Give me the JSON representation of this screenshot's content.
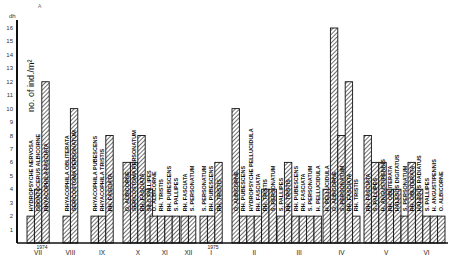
{
  "chart_data": {
    "type": "bar",
    "title": "",
    "xlabel": "",
    "ylabel": "no. of ind./m²",
    "ylim": [
      0,
      16
    ],
    "yticks": [
      1,
      2,
      3,
      4,
      5,
      6,
      7,
      8,
      9,
      10,
      11,
      12,
      13,
      14,
      15,
      16
    ],
    "ytick_unit": "dh",
    "grid": false,
    "corner_mark": "A",
    "year_marks": [
      {
        "label": "1974",
        "after_group": "VII"
      },
      {
        "label": "1975",
        "after_group": "I"
      }
    ],
    "groups": [
      {
        "month": "VII",
        "bars": [
          {
            "value": 2,
            "label": "HYDROPSYCHE NERVOSA"
          },
          {
            "value": 4,
            "label": "ODONTOCERUS ALBICORNE"
          },
          {
            "value": 12,
            "label": "RHYACOPHILA FASCIATA"
          }
        ]
      },
      {
        "month": "VIII",
        "bars": [
          {
            "value": 2,
            "label": "RHYACOPHILA OBLITERATA"
          },
          {
            "value": 10,
            "label": "SERICOSTOMA PERSONATUM"
          }
        ]
      },
      {
        "month": "IX",
        "bars": [
          {
            "value": 2,
            "label": "RHYACOPHILA PUBESCENS"
          },
          {
            "value": 2,
            "label": "RHYACOPHILA TRISTIS"
          },
          {
            "value": 8,
            "label": "RH. FASCIATA"
          }
        ]
      },
      {
        "month": "X",
        "bars": [
          {
            "value": 6,
            "label": "O. ALBICORNE"
          },
          {
            "value": 6,
            "label": "SERICOSTOMA PERSONATUM"
          },
          {
            "value": 8,
            "label": "RH. FASCIATA"
          },
          {
            "value": 4,
            "label": "SILO PALLIPES"
          }
        ]
      },
      {
        "month": "XI",
        "bars": [
          {
            "value": 2,
            "label": "O. ALBICORNE"
          },
          {
            "value": 2,
            "label": "RH. TRISTIS"
          },
          {
            "value": 2,
            "label": "RH. PUBESCENS"
          },
          {
            "value": 2,
            "label": "S. PALLIPES"
          }
        ]
      },
      {
        "month": "XII",
        "bars": [
          {
            "value": 2,
            "label": "RH. FASCIATA"
          },
          {
            "value": 2,
            "label": "S. PERSONATUM"
          }
        ]
      },
      {
        "month": "I",
        "bars": [
          {
            "value": 2,
            "label": "S. PERSONATUM"
          },
          {
            "value": 2,
            "label": "RH. PUBESCENS"
          },
          {
            "value": 6,
            "label": "RH. TRISTIS"
          }
        ]
      },
      {
        "month": "II",
        "bars": [
          {
            "value": 10,
            "label": "O. ALBICORNE"
          },
          {
            "value": 2,
            "label": "RH. PUBESCENS"
          },
          {
            "value": 2,
            "label": "HYDROPSYCHE PELLUCIDULA"
          },
          {
            "value": 2,
            "label": "RH. FASCIATA"
          },
          {
            "value": 4,
            "label": "RH. TRISTIS"
          },
          {
            "value": 4,
            "label": "S. PERSONATUM"
          }
        ]
      },
      {
        "month": "III",
        "bars": [
          {
            "value": 2,
            "label": "S. PALLIPES"
          },
          {
            "value": 6,
            "label": "RH. TRISTIS"
          },
          {
            "value": 2,
            "label": "RH. PUBESCENS"
          },
          {
            "value": 2,
            "label": "RH. FASCIATA"
          },
          {
            "value": 2,
            "label": "S. PERSONATUM"
          },
          {
            "value": 2,
            "label": "H. PELLUCIDULA"
          }
        ]
      },
      {
        "month": "IV",
        "bars": [
          {
            "value": 4,
            "label": "H. PELLUCIDULA"
          },
          {
            "value": 16,
            "label": "O. ALBICORNE"
          },
          {
            "value": 8,
            "label": "S. PERSONATUM"
          },
          {
            "value": 12,
            "label": "RH. FASCIATA"
          },
          {
            "value": 2,
            "label": "RH. TRISTIS"
          }
        ]
      },
      {
        "month": "V",
        "bars": [
          {
            "value": 8,
            "label": "RH. FASCIATA"
          },
          {
            "value": 6,
            "label": "S. PALLIPES"
          },
          {
            "value": 6,
            "label": "H. ANGUSTIPENNIS"
          },
          {
            "value": 4,
            "label": "RH. OBLITERATA"
          },
          {
            "value": 4,
            "label": "HALESUS DIGITATUS"
          },
          {
            "value": 2,
            "label": "S. PERSONATUM"
          }
        ]
      },
      {
        "month": "VI",
        "bars": [
          {
            "value": 6,
            "label": "RH. OBLITERATA"
          },
          {
            "value": 4,
            "label": "HALESUS RADIATUS"
          },
          {
            "value": 2,
            "label": "S. PALLIPES"
          },
          {
            "value": 2,
            "label": "H. ANGUSTIPENNIS"
          },
          {
            "value": 2,
            "label": "O. ALBICORNE"
          }
        ]
      }
    ]
  }
}
